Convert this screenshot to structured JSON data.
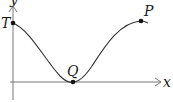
{
  "diagram": {
    "type": "function-graph",
    "axes": {
      "x_label": "x",
      "y_label": "y",
      "origin": [
        13,
        82
      ],
      "x_end": [
        162,
        82
      ],
      "y_end": [
        13,
        6
      ]
    },
    "points": [
      {
        "label": "T",
        "x": 13,
        "y": 23,
        "label_x": 1,
        "label_y": 28
      },
      {
        "label": "Q",
        "x": 73,
        "y": 82,
        "label_x": 67,
        "label_y": 76
      },
      {
        "label": "P",
        "x": 141,
        "y": 21,
        "label_x": 144,
        "label_y": 16
      }
    ],
    "curve": {
      "description": "cosine-like wave from T down to minimum Q on x-axis, up to maximum P",
      "path": "M13,23 C30,30 45,60 60,76 C66,82 70,83 73,82 C78,82 84,78 92,66 C105,46 120,22 141,21 C144,21 146,22 148,23"
    },
    "colors": {
      "axis": "#777777",
      "curve": "#333333",
      "point": "#111111"
    }
  }
}
